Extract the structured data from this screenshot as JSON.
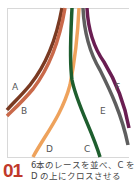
{
  "diagram": {
    "laces": [
      {
        "id": "A",
        "label": "A",
        "color": "#7a3a22"
      },
      {
        "id": "B",
        "label": "B",
        "color": "#c9694a"
      },
      {
        "id": "C",
        "label": "C",
        "color": "#1e5e2e"
      },
      {
        "id": "D",
        "label": "D",
        "color": "#eea25c"
      },
      {
        "id": "E",
        "label": "E",
        "color": "#5e5e5e"
      },
      {
        "id": "F",
        "label": "F",
        "color": "#6a1e52"
      }
    ]
  },
  "step": {
    "number": "01",
    "instruction": "6本のレースを並べ、C を D の上にクロスさせる",
    "number_color": "#c0392b"
  }
}
